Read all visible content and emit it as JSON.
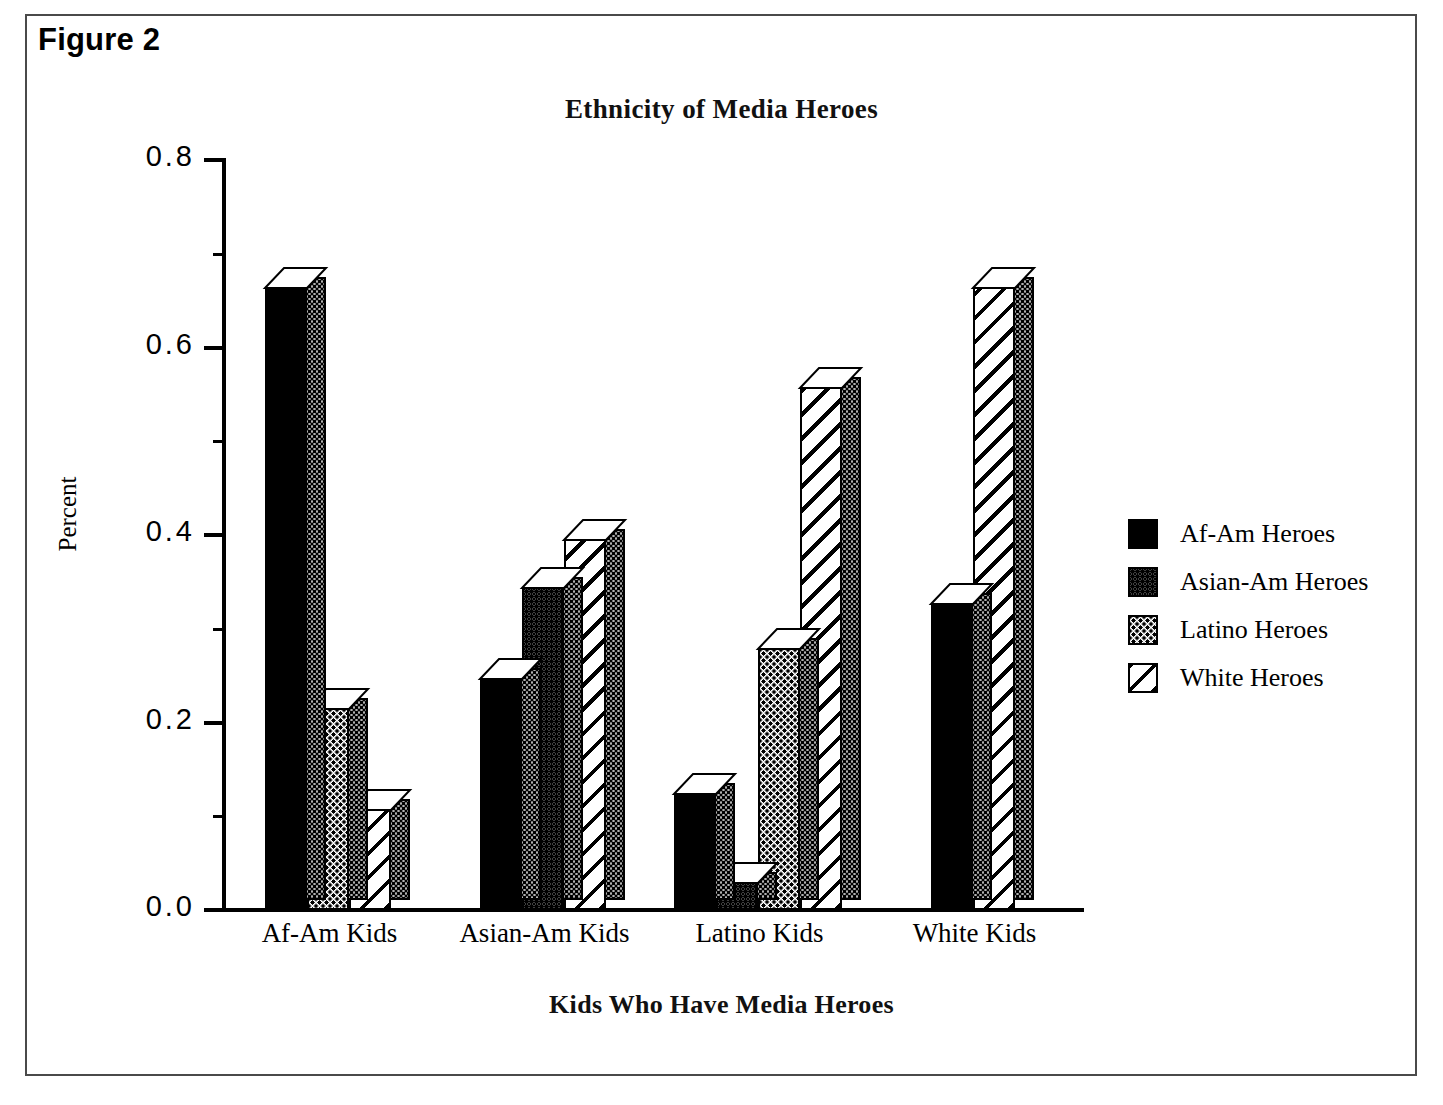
{
  "figure": {
    "label": "Figure 2"
  },
  "chart_data": {
    "type": "bar",
    "title": "Ethnicity of Media Heroes",
    "xlabel": "Kids Who Have Media Heroes",
    "ylabel": "Percent",
    "ylim": [
      0.0,
      0.8
    ],
    "ytick_labels": [
      "0.0",
      "0.2",
      "0.4",
      "0.6",
      "0.8"
    ],
    "ytick_values": [
      0.0,
      0.2,
      0.4,
      0.6,
      0.8
    ],
    "yminor_values": [
      0.1,
      0.3,
      0.5,
      0.7
    ],
    "grid": false,
    "legend_position": "right",
    "categories": [
      "Af-Am Kids",
      "Asian-Am Kids",
      "Latino Kids",
      "White Kids"
    ],
    "series": [
      {
        "name": "Af-Am Heroes",
        "pattern": "solid-black",
        "values": [
          0.665,
          0.248,
          0.125,
          0.328
        ]
      },
      {
        "name": "Asian-Am Heroes",
        "pattern": "dense-dots",
        "values": [
          0.0,
          0.345,
          0.03,
          0.0
        ]
      },
      {
        "name": "Latino Heroes",
        "pattern": "light-dots",
        "values": [
          0.215,
          0.0,
          0.28,
          0.0
        ]
      },
      {
        "name": "White Heroes",
        "pattern": "diagonal-hatch",
        "values": [
          0.108,
          0.396,
          0.558,
          0.665
        ]
      }
    ]
  },
  "colors": {
    "ink": "#000000",
    "frame": "#4a4a4a",
    "paper": "#ffffff"
  }
}
